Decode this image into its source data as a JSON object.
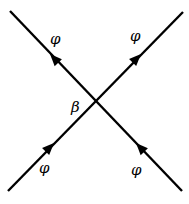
{
  "diagram": {
    "type": "feynman-vertex",
    "vertex_label": "β",
    "lines": [
      {
        "id": "incoming-left",
        "label": "φ",
        "direction": "toward-vertex"
      },
      {
        "id": "incoming-right",
        "label": "φ",
        "direction": "toward-vertex"
      },
      {
        "id": "outgoing-left",
        "label": "φ",
        "direction": "away-from-vertex"
      },
      {
        "id": "outgoing-right",
        "label": "φ",
        "direction": "away-from-vertex"
      }
    ]
  },
  "colors": {
    "line": "#000000",
    "background": "#ffffff"
  }
}
